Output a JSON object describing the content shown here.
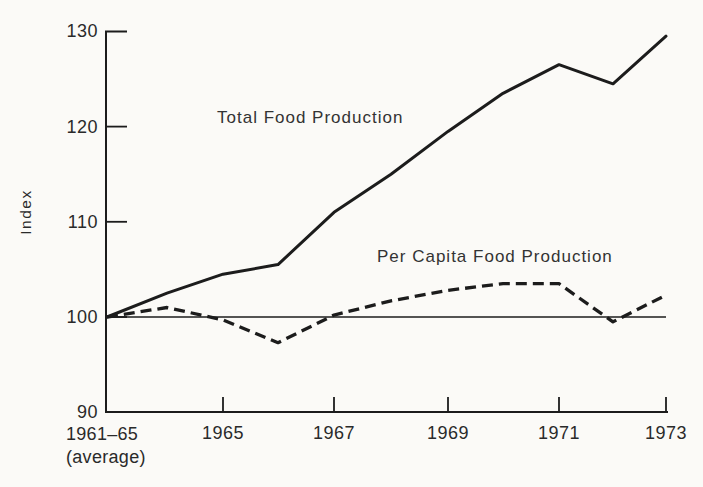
{
  "colors": {
    "line": "#1c1c1c",
    "text": "#2a2a2a",
    "background": "#fbfaf7"
  },
  "chart_data": {
    "type": "line",
    "title": "",
    "xlabel": "",
    "ylabel": "Index",
    "ylim": [
      90,
      130
    ],
    "y_tick_labels": [
      "130",
      "120",
      "110",
      "100",
      "90"
    ],
    "y_tick_values": [
      130,
      120,
      110,
      100,
      90
    ],
    "x_start_label": [
      "1961–65",
      "(average)"
    ],
    "x_tick_labels": [
      "1965",
      "1967",
      "1969",
      "1971",
      "1973"
    ],
    "x_categories": [
      "1961–65 (average)",
      "1964",
      "1965",
      "1966",
      "1967",
      "1968",
      "1969",
      "1970",
      "1971",
      "1972",
      "1973"
    ],
    "reference_line": 100,
    "legend_position": "inline-annotations",
    "grid": false,
    "series": [
      {
        "name": "Total Food Production",
        "style": "solid",
        "values": [
          100,
          102.5,
          104.5,
          105.5,
          111,
          115,
          119.5,
          123.5,
          126.5,
          124.5,
          129.5
        ]
      },
      {
        "name": "Per Capita Food Production",
        "style": "dashed",
        "values": [
          100,
          101,
          99.7,
          97.3,
          100.2,
          101.7,
          102.8,
          103.5,
          103.5,
          99.5,
          102.3
        ]
      }
    ]
  }
}
